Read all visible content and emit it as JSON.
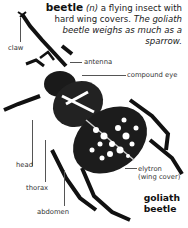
{
  "entry": {
    "headword": "beetle",
    "pos": "(n)",
    "definition": "a flying insect with hard wing covers.",
    "example": "The goliath beetle weighs as much as a sparrow."
  },
  "labels": {
    "claw": "claw",
    "antenna": "antenna",
    "compound_eye": "compound eye",
    "head": "head",
    "thorax": "thorax",
    "abdomen": "abdomen",
    "elytron": "elytron",
    "elytron_note": "(wing cover)"
  },
  "caption": {
    "line1": "goliath",
    "line2": "beetle"
  }
}
